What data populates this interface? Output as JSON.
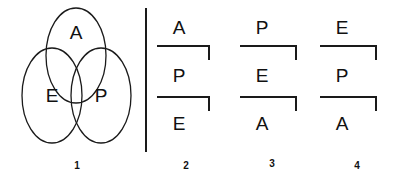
{
  "figure": {
    "width": 408,
    "height": 185,
    "background_color": "#ffffff",
    "stroke_color": "#1a1a1a",
    "text_color": "#111111"
  },
  "venn": {
    "caption": "1",
    "set_top": "A",
    "set_left": "E",
    "set_right": "P",
    "shape": "three-overlapping-ellipses"
  },
  "divider": {
    "orientation": "vertical"
  },
  "sequences": [
    {
      "caption": "2",
      "letters": [
        "A",
        "P",
        "E"
      ]
    },
    {
      "caption": "3",
      "letters": [
        "P",
        "E",
        "A"
      ]
    },
    {
      "caption": "4",
      "letters": [
        "E",
        "P",
        "A"
      ]
    }
  ]
}
